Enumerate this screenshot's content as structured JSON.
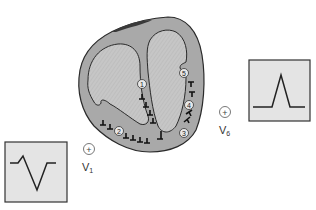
{
  "diagram": {
    "colors": {
      "myocardium": "#a8a8a8",
      "chamber": "#c4c4c4",
      "outline": "#2a2a2a",
      "ecg_box_fill": "#e4e4e4",
      "ecg_trace": "#222222"
    },
    "depolarization_steps": [
      {
        "id": 1,
        "label": "1",
        "region": "septum (left to right)"
      },
      {
        "id": 2,
        "label": "2",
        "region": "apex / inferior wall"
      },
      {
        "id": 3,
        "label": "3",
        "region": "lateral free wall (lower)"
      },
      {
        "id": 4,
        "label": "4",
        "region": "lateral free wall (mid)"
      },
      {
        "id": 5,
        "label": "5",
        "region": "base / upper lateral wall"
      }
    ],
    "leads": [
      {
        "name": "V1",
        "base": "V",
        "sub": "1",
        "electrode_symbol": "+",
        "waveform": "small r, deep S (predominantly negative)"
      },
      {
        "name": "V6",
        "base": "V",
        "sub": "6",
        "electrode_symbol": "+",
        "waveform": "tall R (predominantly positive)"
      }
    ]
  }
}
